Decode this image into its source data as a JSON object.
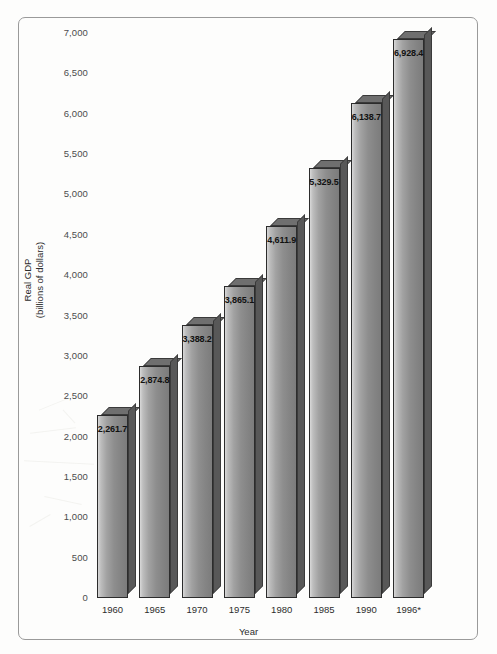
{
  "chart_data": {
    "type": "bar",
    "title": "",
    "xlabel": "Year",
    "ylabel": "Real GDP\n(billions of dollars)",
    "ylabel_line1": "Real GDP",
    "ylabel_line2": "(billions of dollars)",
    "categories": [
      "1960",
      "1965",
      "1970",
      "1975",
      "1980",
      "1985",
      "1990",
      "1996*"
    ],
    "values": [
      2261.7,
      2874.8,
      3388.2,
      3865.1,
      4611.9,
      5329.5,
      6138.7,
      6928.4
    ],
    "value_labels": [
      "2,261.7",
      "2,874.8",
      "3,388.2",
      "3,865.1",
      "4,611.9",
      "5,329.5",
      "6,138.7",
      "6,928.4"
    ],
    "ylim": [
      0,
      7000
    ],
    "ytick_step": 500,
    "ytick_labels": [
      "7,000",
      "6,500",
      "6,000",
      "5,500",
      "5,000",
      "4,500",
      "4,000",
      "3,500",
      "3,000",
      "2,500",
      "2,000",
      "1,500",
      "1,000",
      "500",
      "0"
    ],
    "ytick_values": [
      7000,
      6500,
      6000,
      5500,
      5000,
      4500,
      4000,
      3500,
      3000,
      2500,
      2000,
      1500,
      1000,
      500,
      0
    ],
    "grid": false,
    "legend": null,
    "colors": {
      "bar_front_light": "#d8d8d8",
      "bar_front_dark": "#7c7c7c",
      "bar_top": "#6f6f6f",
      "bar_side": "#585858",
      "bar_outline": "#2c2c2c",
      "frame_border": "#9a9a9a",
      "background": "#fdfdfc",
      "tick_text": "#4c4c4c",
      "axis_title_text": "#2d2d2d",
      "value_label_text": "#111111"
    }
  }
}
